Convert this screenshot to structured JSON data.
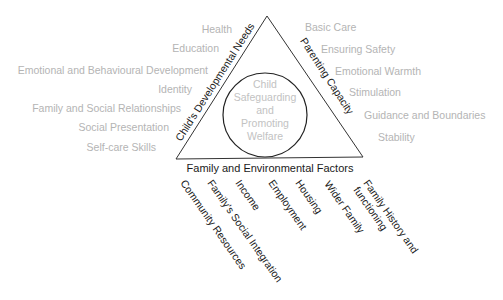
{
  "diagram": {
    "center": {
      "lines": [
        "Child",
        "Safeguarding",
        "and",
        "Promoting",
        "Welfare"
      ]
    },
    "sides": {
      "left": "Child's Developmental Needs",
      "right": "Parenting Capacity",
      "bottom": "Family and Environmental Factors"
    },
    "left_items": [
      "Health",
      "Education",
      "Emotional and Behavioural Development",
      "Identity",
      "Family and Social Relationships",
      "Social Presentation",
      "Self-care Skills"
    ],
    "right_items": [
      "Basic Care",
      "Ensuring Safety",
      "Emotional Warmth",
      "Stimulation",
      "Guidance and Boundaries",
      "Stability"
    ],
    "bottom_items": [
      "Community Resources",
      "Family's Social Integration",
      "Income",
      "Employment",
      "Housing",
      "Wider Family",
      "Family History and",
      "functioning"
    ],
    "colors": {
      "line": "#333333",
      "label_dark": "#1a1a1a",
      "label_grey": "#b4b4b4",
      "background": "#ffffff"
    }
  }
}
